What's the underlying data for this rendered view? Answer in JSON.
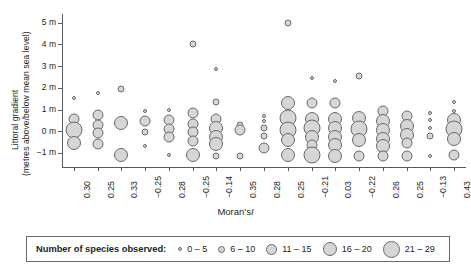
{
  "chart_data": {
    "type": "scatter",
    "title": "",
    "xlabel_prefix": "Moran's",
    "xlabel_italic": "I",
    "ylabel_line1": "Littoral gradient",
    "ylabel_line2": "(metres above/below mean sea level)",
    "ylim": [
      -1.6,
      5.4
    ],
    "yticks": [
      5,
      4,
      3,
      2,
      1,
      0,
      -1
    ],
    "ytick_labels": [
      "5 m",
      "4 m",
      "3 m",
      "2 m",
      "1 m",
      "0 m",
      "−1 m"
    ],
    "grid": false,
    "legend_position": "bottom",
    "size_legend_title": "Number of species observed:",
    "size_classes": [
      {
        "label": "0 – 5",
        "diameter": 4,
        "min": 0,
        "max": 5
      },
      {
        "label": "6 – 10",
        "diameter": 7,
        "min": 6,
        "max": 10
      },
      {
        "label": "11 – 15",
        "diameter": 11,
        "min": 11,
        "max": 15
      },
      {
        "label": "16 – 20",
        "diameter": 14,
        "min": 16,
        "max": 20
      },
      {
        "label": "21 – 29",
        "diameter": 17,
        "min": 21,
        "max": 29
      }
    ],
    "categories": [
      "0.30",
      "0.25",
      "0.33",
      "−0.25",
      "0.28",
      "−0.25",
      "−0.14",
      "0.35",
      "0.28",
      "0.25",
      "−0.21",
      "0.03",
      "−0.22",
      "0.26",
      "0.25",
      "−0.13",
      "0.43"
    ],
    "series": [
      {
        "name": "0.30",
        "points": [
          {
            "y": 1.55,
            "size": 4
          },
          {
            "y": 0.55,
            "size": 11
          },
          {
            "y": 0.05,
            "size": 17
          },
          {
            "y": -0.55,
            "size": 14
          }
        ]
      },
      {
        "name": "0.25",
        "points": [
          {
            "y": 1.75,
            "size": 4
          },
          {
            "y": 0.75,
            "size": 11
          },
          {
            "y": 0.3,
            "size": 11
          },
          {
            "y": -0.1,
            "size": 11
          },
          {
            "y": -0.6,
            "size": 11
          }
        ]
      },
      {
        "name": "0.33",
        "points": [
          {
            "y": 1.95,
            "size": 7
          },
          {
            "y": 0.4,
            "size": 14
          },
          {
            "y": -1.1,
            "size": 14
          }
        ]
      },
      {
        "name": "−0.25",
        "points": [
          {
            "y": 0.95,
            "size": 4
          },
          {
            "y": 0.45,
            "size": 11
          },
          {
            "y": -0.05,
            "size": 7
          },
          {
            "y": -0.7,
            "size": 4
          }
        ]
      },
      {
        "name": "0.28",
        "points": [
          {
            "y": 1.0,
            "size": 4
          },
          {
            "y": 0.5,
            "size": 11
          },
          {
            "y": 0.1,
            "size": 11
          },
          {
            "y": -0.25,
            "size": 11
          },
          {
            "y": -1.1,
            "size": 4
          }
        ]
      },
      {
        "name": "−0.25",
        "points": [
          {
            "y": 4.0,
            "size": 7
          },
          {
            "y": 0.85,
            "size": 11
          },
          {
            "y": 0.35,
            "size": 11
          },
          {
            "y": -0.05,
            "size": 11
          },
          {
            "y": -0.45,
            "size": 11
          },
          {
            "y": -1.1,
            "size": 14
          }
        ]
      },
      {
        "name": "−0.14",
        "points": [
          {
            "y": 2.85,
            "size": 4
          },
          {
            "y": 1.35,
            "size": 7
          },
          {
            "y": 0.55,
            "size": 11
          },
          {
            "y": 0.15,
            "size": 14
          },
          {
            "y": -0.25,
            "size": 14
          },
          {
            "y": -0.6,
            "size": 14
          },
          {
            "y": -1.15,
            "size": 7
          }
        ]
      },
      {
        "name": "0.35",
        "points": [
          {
            "y": 0.3,
            "size": 7
          },
          {
            "y": 0.05,
            "size": 11
          },
          {
            "y": -1.15,
            "size": 7
          }
        ]
      },
      {
        "name": "0.28",
        "points": [
          {
            "y": 0.7,
            "size": 4
          },
          {
            "y": 0.45,
            "size": 4
          },
          {
            "y": 0.15,
            "size": 7
          },
          {
            "y": -0.2,
            "size": 7
          },
          {
            "y": -0.75,
            "size": 11
          }
        ]
      },
      {
        "name": "0.25",
        "points": [
          {
            "y": 5.0,
            "size": 7
          },
          {
            "y": 1.3,
            "size": 14
          },
          {
            "y": 0.6,
            "size": 17
          },
          {
            "y": 0.05,
            "size": 17
          },
          {
            "y": -0.4,
            "size": 14
          },
          {
            "y": -1.1,
            "size": 14
          }
        ]
      },
      {
        "name": "−0.21",
        "points": [
          {
            "y": 2.45,
            "size": 4
          },
          {
            "y": 1.3,
            "size": 11
          },
          {
            "y": 0.55,
            "size": 14
          },
          {
            "y": 0.15,
            "size": 17
          },
          {
            "y": -0.25,
            "size": 14
          },
          {
            "y": -0.65,
            "size": 11
          },
          {
            "y": -1.1,
            "size": 17
          }
        ]
      },
      {
        "name": "0.03",
        "points": [
          {
            "y": 2.3,
            "size": 4
          },
          {
            "y": 1.3,
            "size": 11
          },
          {
            "y": 0.55,
            "size": 14
          },
          {
            "y": 0.15,
            "size": 14
          },
          {
            "y": -0.25,
            "size": 14
          },
          {
            "y": -0.65,
            "size": 14
          },
          {
            "y": -1.15,
            "size": 14
          }
        ]
      },
      {
        "name": "−0.22",
        "points": [
          {
            "y": 2.55,
            "size": 7
          },
          {
            "y": 0.6,
            "size": 14
          },
          {
            "y": 0.1,
            "size": 17
          },
          {
            "y": -0.4,
            "size": 14
          },
          {
            "y": -1.15,
            "size": 11
          }
        ]
      },
      {
        "name": "0.26",
        "points": [
          {
            "y": 0.95,
            "size": 11
          },
          {
            "y": 0.45,
            "size": 14
          },
          {
            "y": 0.05,
            "size": 14
          },
          {
            "y": -0.35,
            "size": 14
          },
          {
            "y": -0.7,
            "size": 14
          },
          {
            "y": -1.15,
            "size": 11
          }
        ]
      },
      {
        "name": "0.25",
        "points": [
          {
            "y": 0.7,
            "size": 11
          },
          {
            "y": 0.25,
            "size": 14
          },
          {
            "y": -0.15,
            "size": 14
          },
          {
            "y": -0.55,
            "size": 11
          },
          {
            "y": -1.15,
            "size": 11
          }
        ]
      },
      {
        "name": "−0.13",
        "points": [
          {
            "y": 0.85,
            "size": 4
          },
          {
            "y": 0.5,
            "size": 4
          },
          {
            "y": 0.15,
            "size": 4
          },
          {
            "y": -0.2,
            "size": 7
          },
          {
            "y": -1.15,
            "size": 4
          }
        ]
      },
      {
        "name": "0.43",
        "points": [
          {
            "y": 1.35,
            "size": 4
          },
          {
            "y": 0.95,
            "size": 4
          },
          {
            "y": 0.5,
            "size": 14
          },
          {
            "y": 0.1,
            "size": 17
          },
          {
            "y": -0.35,
            "size": 14
          },
          {
            "y": -1.1,
            "size": 11
          }
        ]
      }
    ]
  }
}
